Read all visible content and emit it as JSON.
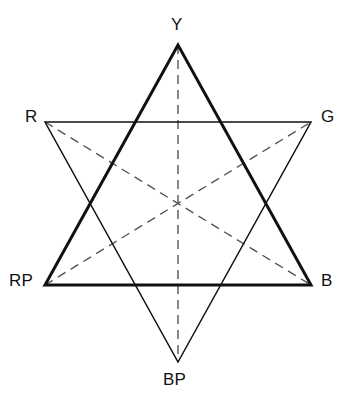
{
  "figure": {
    "background_color": "#ffffff",
    "stroke_color": "#111111",
    "dash_color": "#555555",
    "width": 355,
    "height": 407
  },
  "labels": {
    "y": "Y",
    "r": "R",
    "g": "G",
    "rp": "RP",
    "b": "B",
    "bp": "BP"
  },
  "chart_data": {
    "type": "diagram",
    "xlabel": "",
    "ylabel": "",
    "vertices": [
      {
        "id": "Y",
        "label": "Y",
        "x": 178,
        "y": 45,
        "position": "top"
      },
      {
        "id": "R",
        "label": "R",
        "x": 45,
        "y": 122,
        "position": "upper-left"
      },
      {
        "id": "G",
        "label": "G",
        "x": 311,
        "y": 122,
        "position": "upper-right"
      },
      {
        "id": "RP",
        "label": "RP",
        "x": 45,
        "y": 285,
        "position": "lower-left"
      },
      {
        "id": "B",
        "label": "B",
        "x": 311,
        "y": 285,
        "position": "lower-right"
      },
      {
        "id": "BP",
        "label": "BP",
        "x": 178,
        "y": 362,
        "position": "bottom"
      }
    ],
    "center": {
      "x": 178,
      "y": 203
    },
    "triangles": [
      {
        "id": "upward-triangle",
        "vertices": [
          "Y",
          "RP",
          "B"
        ],
        "stroke": "#111111",
        "stroke_width": 3.0,
        "style": "solid",
        "emphasis": "heavy"
      },
      {
        "id": "downward-triangle",
        "vertices": [
          "R",
          "G",
          "BP"
        ],
        "stroke": "#111111",
        "stroke_width": 1.5,
        "style": "solid",
        "emphasis": "light"
      }
    ],
    "diagonals": [
      {
        "id": "Y-BP",
        "from": "Y",
        "to": "BP",
        "style": "dashed",
        "stroke": "#555555",
        "stroke_width": 1.4
      },
      {
        "id": "R-B",
        "from": "R",
        "to": "B",
        "style": "dashed",
        "stroke": "#555555",
        "stroke_width": 1.4
      },
      {
        "id": "RP-G",
        "from": "RP",
        "to": "G",
        "style": "dashed",
        "stroke": "#555555",
        "stroke_width": 1.4
      }
    ],
    "legend": [],
    "annotations": [],
    "grid": false
  }
}
